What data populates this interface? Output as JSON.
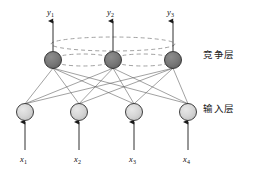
{
  "figure": {
    "type": "neural-network-diagram",
    "width": 258,
    "height": 175,
    "background": "#ffffff"
  },
  "layers": {
    "competitive": {
      "label": "竞争层",
      "label_x": 203,
      "label_y": 55,
      "node_fill": "#777777",
      "node_stroke": "#2b2b2b",
      "node_radius": 8.5,
      "center_y": 60,
      "nodes": [
        {
          "name": "competitive-node-1",
          "cx": 53,
          "cy": 60
        },
        {
          "name": "competitive-node-2",
          "cx": 113,
          "cy": 60
        },
        {
          "name": "competitive-node-3",
          "cx": 173,
          "cy": 60
        }
      ]
    },
    "input": {
      "label": "输入层",
      "label_x": 203,
      "label_y": 108,
      "node_fill": "#d3d3d3",
      "node_stroke": "#2b2b2b",
      "node_radius": 8.5,
      "center_y": 112,
      "nodes": [
        {
          "name": "input-node-1",
          "cx": 25,
          "cy": 112
        },
        {
          "name": "input-node-2",
          "cx": 79,
          "cy": 112
        },
        {
          "name": "input-node-3",
          "cx": 134,
          "cy": 112
        },
        {
          "name": "input-node-4",
          "cx": 188,
          "cy": 112
        }
      ]
    }
  },
  "outputs": [
    {
      "name": "output-label-y1",
      "text": "y",
      "sub": "1",
      "x": 47,
      "y": 12
    },
    {
      "name": "output-label-y2",
      "text": "y",
      "sub": "2",
      "x": 107,
      "y": 12
    },
    {
      "name": "output-label-y3",
      "text": "y",
      "sub": "3",
      "x": 167,
      "y": 12
    }
  ],
  "inputs": [
    {
      "name": "input-label-x1",
      "text": "x",
      "sub": "1",
      "x": 20,
      "y": 158
    },
    {
      "name": "input-label-x2",
      "text": "x",
      "sub": "2",
      "x": 74,
      "y": 158
    },
    {
      "name": "input-label-x3",
      "text": "x",
      "sub": "3",
      "x": 129,
      "y": 158
    },
    {
      "name": "input-label-x4",
      "text": "x",
      "sub": "4",
      "x": 183,
      "y": 158
    }
  ],
  "lateral_connections": {
    "style": "dashed",
    "stroke": "#8a8a8a",
    "dasharray": "4 3",
    "ellipses": [
      {
        "name": "lateral-ellipse-wide",
        "cx": 113,
        "cy": 44,
        "rx": 62,
        "ry": 7
      },
      {
        "name": "lateral-ellipse-left",
        "cx": 83,
        "cy": 60,
        "rx": 31,
        "ry": 6
      },
      {
        "name": "lateral-ellipse-right",
        "cx": 143,
        "cy": 60,
        "rx": 31,
        "ry": 6
      }
    ]
  },
  "weights": {
    "stroke": "#555555",
    "description": "fully-connected input-to-competitive links",
    "count": 12
  },
  "arrows": {
    "stroke": "#1a1a1a",
    "output_arrow_top_y": 20,
    "input_arrow_bottom_y": 150
  }
}
